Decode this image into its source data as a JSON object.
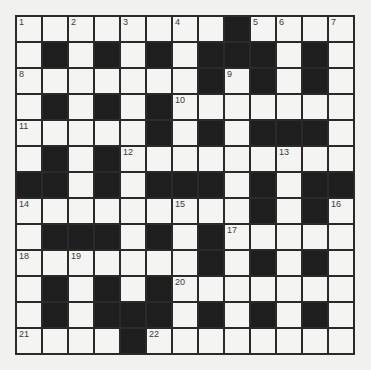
{
  "puzzle": {
    "type": "crossword",
    "size": 13,
    "colors": {
      "white_cell": "#f4f4f2",
      "black_cell": "#1e1e1e",
      "grid_line": "#2a2a2a",
      "background": "#f1f1ef"
    },
    "rows": [
      "WWWWWWWWBWWWW",
      "WBWBWBWBBBWBW",
      "WWWWWWWBWBWBW",
      "WBWBWBWWWWWWW",
      "WWWWWBWBWBBBW",
      "WBWBWWWWWWWWW",
      "BBWBWBBBWBWBB",
      "WWWWWWWWWBWBW",
      "WBBBWBWBWWWWW",
      "WWWWWWWBWBWBW",
      "WBWBWBWWWWWWW",
      "WBWBBBWBWBWBW",
      "WWWWBWWWWWWWW"
    ],
    "numbers": [
      {
        "r": 0,
        "c": 0,
        "n": "1"
      },
      {
        "r": 0,
        "c": 2,
        "n": "2"
      },
      {
        "r": 0,
        "c": 4,
        "n": "3"
      },
      {
        "r": 0,
        "c": 6,
        "n": "4"
      },
      {
        "r": 0,
        "c": 9,
        "n": "5"
      },
      {
        "r": 0,
        "c": 10,
        "n": "6"
      },
      {
        "r": 0,
        "c": 12,
        "n": "7"
      },
      {
        "r": 2,
        "c": 0,
        "n": "8"
      },
      {
        "r": 2,
        "c": 8,
        "n": "9"
      },
      {
        "r": 3,
        "c": 6,
        "n": "10"
      },
      {
        "r": 4,
        "c": 0,
        "n": "11"
      },
      {
        "r": 5,
        "c": 4,
        "n": "12"
      },
      {
        "r": 5,
        "c": 10,
        "n": "13"
      },
      {
        "r": 7,
        "c": 0,
        "n": "14"
      },
      {
        "r": 7,
        "c": 6,
        "n": "15"
      },
      {
        "r": 7,
        "c": 12,
        "n": "16"
      },
      {
        "r": 8,
        "c": 8,
        "n": "17"
      },
      {
        "r": 9,
        "c": 0,
        "n": "18"
      },
      {
        "r": 9,
        "c": 2,
        "n": "19"
      },
      {
        "r": 10,
        "c": 6,
        "n": "20"
      },
      {
        "r": 12,
        "c": 0,
        "n": "21"
      },
      {
        "r": 12,
        "c": 5,
        "n": "22"
      }
    ]
  }
}
